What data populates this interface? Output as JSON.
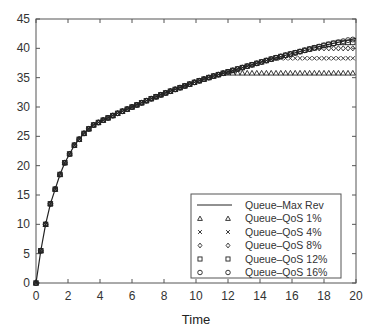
{
  "chart_data": {
    "type": "line",
    "title": "",
    "xlabel": "Time",
    "ylabel": "",
    "xlim": [
      0,
      20
    ],
    "ylim": [
      0,
      45
    ],
    "xticks": [
      0,
      2,
      4,
      6,
      8,
      10,
      12,
      14,
      16,
      18,
      20
    ],
    "yticks": [
      0,
      5,
      10,
      15,
      20,
      25,
      30,
      35,
      40,
      45
    ],
    "grid": false,
    "legend_position": "lower right",
    "series": [
      {
        "name": "Queue–Max Rev",
        "style": "line",
        "x": [
          0,
          0.3,
          0.6,
          0.9,
          1.2,
          1.5,
          1.8,
          2.1,
          2.4,
          2.7,
          3,
          3.5,
          4,
          5,
          6,
          7,
          8,
          9,
          10,
          11,
          12,
          13,
          14,
          15,
          16,
          17,
          18,
          19,
          20
        ],
        "values": [
          0,
          5.5,
          10,
          13.5,
          16,
          18.5,
          20.5,
          22,
          23.5,
          24.5,
          25.5,
          26.8,
          27.5,
          28.8,
          30,
          31.2,
          32.3,
          33.3,
          34.3,
          35.2,
          36,
          36.8,
          37.6,
          38.4,
          39.1,
          39.8,
          40.5,
          41.1,
          41.7
        ]
      },
      {
        "name": "Queue–QoS 1%",
        "marker": "triangle",
        "plateau": 35.8,
        "plateau_start": 12.3
      },
      {
        "name": "Queue–QoS 4%",
        "marker": "x",
        "plateau": 38.3,
        "plateau_start": 15.0
      },
      {
        "name": "Queue–QoS 8%",
        "marker": "diamond",
        "plateau": 40.0,
        "plateau_start": 17.3
      },
      {
        "name": "Queue–QoS 12%",
        "marker": "square",
        "plateau": 41.0,
        "plateau_start": 18.5
      },
      {
        "name": "Queue–QoS 16%",
        "marker": "circle",
        "plateau": 41.5,
        "plateau_start": 19.5
      }
    ],
    "marker_step": 0.3
  },
  "legend": {
    "items": [
      {
        "label": "Queue–Max Rev",
        "symbol": "line"
      },
      {
        "label": "Queue–QoS 1%",
        "symbol": "triangle"
      },
      {
        "label": "Queue–QoS 4%",
        "symbol": "x"
      },
      {
        "label": "Queue–QoS 8%",
        "symbol": "diamond"
      },
      {
        "label": "Queue–QoS 12%",
        "symbol": "square"
      },
      {
        "label": "Queue–QoS 16%",
        "symbol": "circle"
      }
    ]
  },
  "colors": {
    "ink": "#222222",
    "axis": "#444444",
    "background": "#ffffff"
  }
}
